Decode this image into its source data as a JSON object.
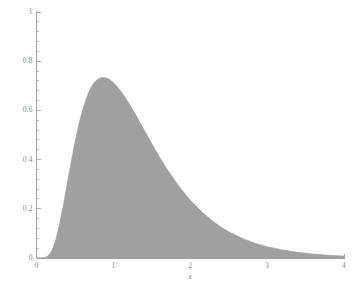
{
  "chart_data": {
    "type": "area",
    "title": "",
    "subtitle": "",
    "xlabel": "x",
    "ylabel": "",
    "xlim": [
      0,
      4.05
    ],
    "ylim": [
      0,
      1.0
    ],
    "grid": false,
    "legend": null,
    "fill_color": "#a0a0a0",
    "axis_color": "#9a9a9a",
    "label_color": "#8a8a8a",
    "xticks": [
      0,
      1,
      2,
      3,
      4
    ],
    "xtick_labels": [
      "0",
      "1",
      "2",
      "3",
      "4"
    ],
    "yticks": [
      0,
      0.2,
      0.4,
      0.6,
      0.8,
      1
    ],
    "ytick_labels": [
      "0",
      "0.2",
      "0.4",
      "0.6",
      "0.8",
      "1"
    ],
    "x_minor_tick_count": 4,
    "y_minor_tick_count": 4,
    "peak": {
      "x": 0.95,
      "y": 0.73
    },
    "x": [
      0.0,
      0.05,
      0.1,
      0.15,
      0.2,
      0.25,
      0.3,
      0.35,
      0.4,
      0.45,
      0.5,
      0.55,
      0.6,
      0.65,
      0.7,
      0.75,
      0.8,
      0.85,
      0.9,
      0.95,
      1.0,
      1.05,
      1.1,
      1.15,
      1.2,
      1.25,
      1.3,
      1.35,
      1.4,
      1.45,
      1.5,
      1.55,
      1.6,
      1.65,
      1.7,
      1.75,
      1.8,
      1.85,
      1.9,
      1.95,
      2.0,
      2.1,
      2.2,
      2.3,
      2.4,
      2.5,
      2.6,
      2.7,
      2.8,
      2.9,
      3.0,
      3.2,
      3.4,
      3.6,
      3.8,
      4.0
    ],
    "y": [
      0.0,
      0.0,
      0.001,
      0.008,
      0.03,
      0.073,
      0.137,
      0.216,
      0.303,
      0.389,
      0.47,
      0.542,
      0.602,
      0.651,
      0.688,
      0.713,
      0.728,
      0.734,
      0.733,
      0.726,
      0.713,
      0.697,
      0.677,
      0.654,
      0.63,
      0.604,
      0.577,
      0.549,
      0.521,
      0.493,
      0.465,
      0.438,
      0.411,
      0.386,
      0.361,
      0.338,
      0.315,
      0.294,
      0.273,
      0.254,
      0.236,
      0.203,
      0.174,
      0.148,
      0.126,
      0.107,
      0.091,
      0.077,
      0.065,
      0.055,
      0.046,
      0.033,
      0.023,
      0.016,
      0.011,
      0.008
    ]
  },
  "axes": {
    "x_title": "x"
  }
}
